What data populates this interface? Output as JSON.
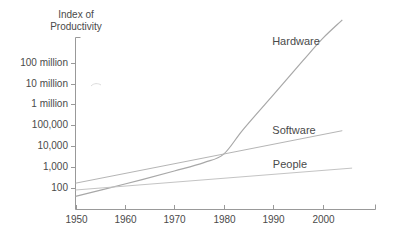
{
  "title": {
    "line1": "Index of",
    "line2": "Productivity"
  },
  "chart_data": {
    "type": "line",
    "title": "Index of Productivity",
    "x_axis": {
      "ticks": [
        1950,
        1960,
        1970,
        1980,
        1990,
        2000
      ],
      "range": [
        1950,
        2010
      ]
    },
    "y_axis": {
      "scale": "log",
      "ticks": [
        {
          "label": "100 million",
          "value": 100000000
        },
        {
          "label": "10 million",
          "value": 10000000
        },
        {
          "label": "1 million",
          "value": 1000000
        },
        {
          "label": "100,000",
          "value": 100000
        },
        {
          "label": "10,000",
          "value": 10000
        },
        {
          "label": "1,000",
          "value": 1000
        },
        {
          "label": "100",
          "value": 100
        }
      ],
      "range": [
        40,
        10000000000
      ]
    },
    "grid": "off",
    "legend": "inline-labels",
    "axis_color": "#999999",
    "series": [
      {
        "name": "Hardware",
        "color": "#a8a8a8",
        "points": [
          [
            1950,
            40
          ],
          [
            1960,
            155
          ],
          [
            1970,
            650
          ],
          [
            1976,
            1650
          ],
          [
            1980,
            4200
          ],
          [
            1984,
            66000
          ],
          [
            1990,
            2800000
          ],
          [
            1996,
            120000000
          ],
          [
            2000,
            1400000000
          ],
          [
            2004,
            11000000000
          ]
        ],
        "label_pos": {
          "x": 296,
          "y": 41
        }
      },
      {
        "name": "Software",
        "color": "#b5b5b5",
        "points": [
          [
            1950,
            170
          ],
          [
            2004,
            55000
          ]
        ],
        "label_pos": {
          "x": 294,
          "y": 130
        }
      },
      {
        "name": "People",
        "color": "#c4c4c4",
        "points": [
          [
            1950,
            80
          ],
          [
            2006,
            900
          ]
        ],
        "label_pos": {
          "x": 290,
          "y": 164
        }
      }
    ]
  }
}
